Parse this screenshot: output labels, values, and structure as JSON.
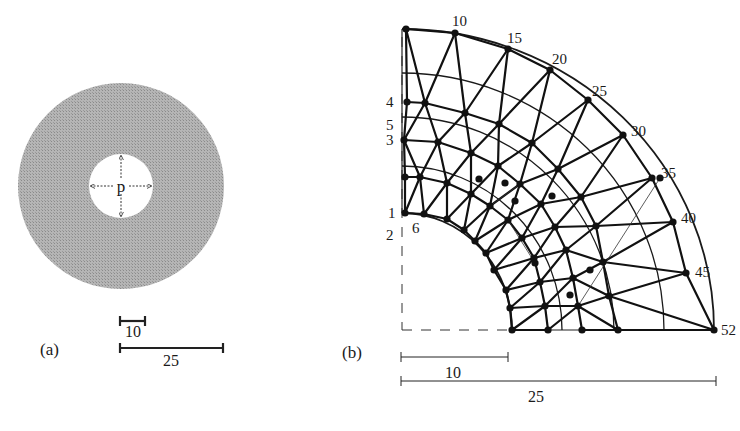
{
  "figure": {
    "panels": [
      {
        "id": "a",
        "label": "(a)",
        "description": "Annular disk under internal pressure",
        "inner_label": "p",
        "center": [
          121,
          186
        ],
        "outer_radius": 103,
        "inner_radius": 32,
        "fill_color": "#a9a9a9",
        "scale_bars": [
          {
            "label": "10",
            "x1": 120,
            "x2": 145,
            "y": 321,
            "label_x": 133,
            "label_y": 337
          },
          {
            "label": "25",
            "x1": 120,
            "x2": 223,
            "y": 348,
            "label_x": 171,
            "label_y": 366
          }
        ],
        "label_pos": [
          40,
          355
        ]
      },
      {
        "id": "b",
        "label": "(b)",
        "description": "Finite element mesh of quarter annulus",
        "label_pos": [
          342,
          358
        ],
        "center": [
          402,
          330
        ],
        "inner_rx": 110,
        "inner_ry": 117,
        "outer_rx": 312,
        "outer_ry": 301,
        "mid_rings": [
          {
            "rx": 160,
            "ry": 164
          },
          {
            "rx": 212,
            "ry": 213
          },
          {
            "rx": 262,
            "ry": 257
          }
        ],
        "node_labels": [
          {
            "text": "10",
            "x": 452,
            "y": 26
          },
          {
            "text": "15",
            "x": 507,
            "y": 43
          },
          {
            "text": "20",
            "x": 552,
            "y": 64
          },
          {
            "text": "25",
            "x": 592,
            "y": 96
          },
          {
            "text": "30",
            "x": 631,
            "y": 136
          },
          {
            "text": "35",
            "x": 661,
            "y": 178
          },
          {
            "text": "40",
            "x": 681,
            "y": 223
          },
          {
            "text": "45",
            "x": 695,
            "y": 277
          },
          {
            "text": "52",
            "x": 721,
            "y": 335
          },
          {
            "text": "4",
            "x": 386,
            "y": 107
          },
          {
            "text": "5",
            "x": 386,
            "y": 130
          },
          {
            "text": "3",
            "x": 386,
            "y": 145
          },
          {
            "text": "1",
            "x": 388,
            "y": 218
          },
          {
            "text": "2",
            "x": 386,
            "y": 240
          },
          {
            "text": "6",
            "x": 412,
            "y": 233
          }
        ],
        "nodes": [
          [
            406,
            29
          ],
          [
            455,
            33
          ],
          [
            508,
            49
          ],
          [
            550,
            70
          ],
          [
            588,
            100
          ],
          [
            623,
            135
          ],
          [
            652,
            178
          ],
          [
            673,
            222
          ],
          [
            686,
            273
          ],
          [
            714,
            330
          ],
          [
            407,
            102
          ],
          [
            404,
            140
          ],
          [
            405,
            177
          ],
          [
            405,
            213
          ],
          [
            424,
            214
          ],
          [
            447,
            219
          ],
          [
            464,
            230
          ],
          [
            475,
            241
          ],
          [
            486,
            253
          ],
          [
            494,
            270
          ],
          [
            506,
            290
          ],
          [
            510,
            308
          ],
          [
            512,
            330
          ],
          [
            425,
            103
          ],
          [
            465,
            113
          ],
          [
            499,
            124
          ],
          [
            532,
            143
          ],
          [
            558,
            169
          ],
          [
            581,
            197
          ],
          [
            596,
            226
          ],
          [
            603,
            262
          ],
          [
            609,
            296
          ],
          [
            618,
            330
          ],
          [
            438,
            142
          ],
          [
            471,
            153
          ],
          [
            498,
            166
          ],
          [
            520,
            184
          ],
          [
            541,
            204
          ],
          [
            555,
            227
          ],
          [
            566,
            250
          ],
          [
            573,
            278
          ],
          [
            578,
            306
          ],
          [
            582,
            330
          ],
          [
            420,
            177
          ],
          [
            447,
            183
          ],
          [
            471,
            194
          ],
          [
            490,
            206
          ],
          [
            508,
            220
          ],
          [
            522,
            238
          ],
          [
            534,
            258
          ],
          [
            540,
            282
          ],
          [
            545,
            306
          ],
          [
            548,
            330
          ],
          [
            479,
            179
          ],
          [
            505,
            183
          ],
          [
            515,
            201
          ],
          [
            552,
            196
          ],
          [
            535,
            263
          ],
          [
            590,
            270
          ],
          [
            570,
            295
          ],
          [
            660,
            178
          ]
        ],
        "edges": [
          [
            0,
            1
          ],
          [
            1,
            2
          ],
          [
            2,
            3
          ],
          [
            3,
            4
          ],
          [
            4,
            5
          ],
          [
            5,
            6
          ],
          [
            6,
            7
          ],
          [
            7,
            8
          ],
          [
            8,
            9
          ],
          [
            0,
            10
          ],
          [
            10,
            11
          ],
          [
            11,
            12
          ],
          [
            12,
            13
          ],
          [
            13,
            14
          ],
          [
            14,
            15
          ],
          [
            15,
            16
          ],
          [
            16,
            17
          ],
          [
            17,
            18
          ],
          [
            18,
            19
          ],
          [
            19,
            20
          ],
          [
            20,
            21
          ],
          [
            21,
            22
          ],
          [
            0,
            23
          ],
          [
            23,
            1
          ],
          [
            1,
            24
          ],
          [
            24,
            2
          ],
          [
            2,
            25
          ],
          [
            25,
            3
          ],
          [
            3,
            26
          ],
          [
            26,
            4
          ],
          [
            4,
            27
          ],
          [
            27,
            5
          ],
          [
            5,
            28
          ],
          [
            28,
            6
          ],
          [
            6,
            29
          ],
          [
            29,
            7
          ],
          [
            7,
            30
          ],
          [
            30,
            8
          ],
          [
            8,
            31
          ],
          [
            31,
            9
          ],
          [
            10,
            23
          ],
          [
            23,
            24
          ],
          [
            24,
            25
          ],
          [
            25,
            26
          ],
          [
            26,
            27
          ],
          [
            27,
            28
          ],
          [
            28,
            29
          ],
          [
            29,
            30
          ],
          [
            30,
            31
          ],
          [
            31,
            32
          ],
          [
            32,
            9
          ],
          [
            23,
            11
          ],
          [
            11,
            33
          ],
          [
            33,
            23
          ],
          [
            33,
            24
          ],
          [
            24,
            34
          ],
          [
            34,
            25
          ],
          [
            25,
            35
          ],
          [
            35,
            26
          ],
          [
            26,
            36
          ],
          [
            36,
            27
          ],
          [
            27,
            37
          ],
          [
            37,
            28
          ],
          [
            28,
            38
          ],
          [
            38,
            29
          ],
          [
            29,
            39
          ],
          [
            39,
            30
          ],
          [
            30,
            40
          ],
          [
            40,
            31
          ],
          [
            31,
            41
          ],
          [
            41,
            32
          ],
          [
            32,
            42
          ],
          [
            33,
            34
          ],
          [
            34,
            35
          ],
          [
            35,
            36
          ],
          [
            36,
            37
          ],
          [
            37,
            38
          ],
          [
            38,
            39
          ],
          [
            39,
            40
          ],
          [
            40,
            41
          ],
          [
            41,
            42
          ],
          [
            11,
            43
          ],
          [
            43,
            33
          ],
          [
            33,
            44
          ],
          [
            44,
            34
          ],
          [
            34,
            45
          ],
          [
            45,
            35
          ],
          [
            35,
            46
          ],
          [
            46,
            36
          ],
          [
            36,
            47
          ],
          [
            47,
            37
          ],
          [
            37,
            48
          ],
          [
            48,
            38
          ],
          [
            38,
            49
          ],
          [
            49,
            39
          ],
          [
            39,
            50
          ],
          [
            50,
            40
          ],
          [
            40,
            51
          ],
          [
            51,
            41
          ],
          [
            41,
            52
          ],
          [
            12,
            43
          ],
          [
            43,
            44
          ],
          [
            44,
            45
          ],
          [
            45,
            46
          ],
          [
            46,
            47
          ],
          [
            47,
            48
          ],
          [
            48,
            49
          ],
          [
            49,
            50
          ],
          [
            50,
            51
          ],
          [
            51,
            52
          ],
          [
            43,
            13
          ],
          [
            43,
            14
          ],
          [
            44,
            14
          ],
          [
            44,
            15
          ],
          [
            45,
            15
          ],
          [
            45,
            16
          ],
          [
            46,
            16
          ],
          [
            46,
            17
          ],
          [
            47,
            17
          ],
          [
            47,
            18
          ],
          [
            48,
            18
          ],
          [
            48,
            19
          ],
          [
            49,
            19
          ],
          [
            49,
            20
          ],
          [
            50,
            20
          ],
          [
            50,
            21
          ],
          [
            51,
            21
          ],
          [
            51,
            22
          ],
          [
            52,
            22
          ]
        ],
        "thin_edges": [
          [
            36,
            46
          ],
          [
            47,
            57
          ],
          [
            41,
            60
          ]
        ],
        "scale_bars": [
          {
            "label": "10",
            "x1": 401,
            "x2": 508,
            "y": 357,
            "label_x": 453,
            "label_y": 378
          },
          {
            "label": "25",
            "x1": 401,
            "x2": 716,
            "y": 381,
            "label_x": 536,
            "label_y": 402
          }
        ],
        "dashed_axes": {
          "color": "#333333"
        }
      }
    ],
    "caption_hint": ""
  }
}
